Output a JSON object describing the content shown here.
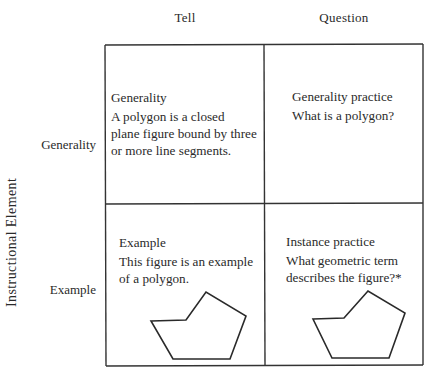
{
  "columns": {
    "tell": "Tell",
    "question": "Question"
  },
  "rows": {
    "generality": "Generality",
    "example": "Example"
  },
  "axis": {
    "vertical_label": "Instructional Element"
  },
  "cells": {
    "generality_tell": {
      "title": "Generality",
      "lines": [
        "A polygon is a closed",
        "plane figure bound by three",
        "or more line segments."
      ]
    },
    "generality_question": {
      "title": "Generality practice",
      "lines": [
        "What is a polygon?"
      ]
    },
    "example_tell": {
      "title": "Example",
      "lines": [
        "This figure is an example",
        "of a polygon."
      ],
      "figure": "polygon-figure"
    },
    "example_question": {
      "title": "Instance practice",
      "lines": [
        "What geometric term",
        "describes the figure?*"
      ],
      "figure": "polygon-figure"
    }
  },
  "colors": {
    "line": "#333333",
    "text": "#2a2a2a",
    "background": "#ffffff"
  }
}
